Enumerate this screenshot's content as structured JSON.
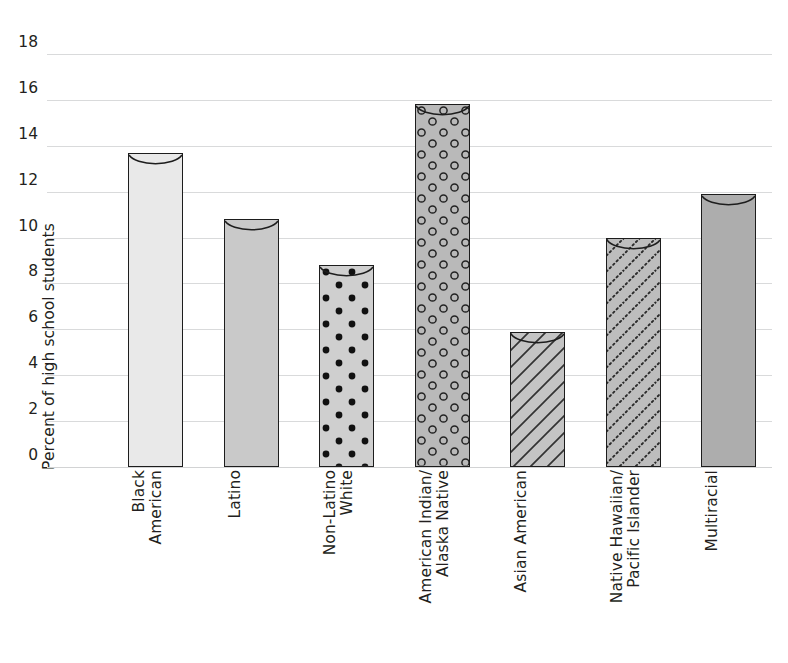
{
  "chart_data": {
    "type": "bar",
    "title": "",
    "xlabel": "",
    "ylabel": "Percent of high school students",
    "ylim": [
      0,
      18
    ],
    "ytick_step": 2,
    "yticks": [
      "18",
      "16",
      "14",
      "12",
      "10",
      "8",
      "6",
      "4",
      "2",
      "0"
    ],
    "grid": true,
    "legend": "none",
    "categories": [
      "Black American",
      "Latino",
      "Non-Latino White",
      "American Indian/ Alaska Native",
      "Asian American",
      "Native Hawaiian/ Pacific Islander",
      "Multiracial"
    ],
    "category_lines": [
      [
        "Black",
        "American"
      ],
      [
        "Latino"
      ],
      [
        "Non-Latino",
        "White"
      ],
      [
        "American Indian/",
        "Alaska Native"
      ],
      [
        "Asian American"
      ],
      [
        "Native Hawaiian/",
        "Pacific Islander"
      ],
      [
        "Multiracial"
      ]
    ],
    "values": [
      13.7,
      10.8,
      8.8,
      15.8,
      5.9,
      10.0,
      11.9
    ],
    "bar_styles": [
      {
        "fill": "#e9e9e9",
        "pattern": "solid"
      },
      {
        "fill": "#c9c9c9",
        "pattern": "solid"
      },
      {
        "fill": "#cfcfcf",
        "pattern": "dots-filled"
      },
      {
        "fill": "#b9b9b9",
        "pattern": "circles-open"
      },
      {
        "fill": "#c4c4c4",
        "pattern": "diagonal-lines"
      },
      {
        "fill": "#bdbdbd",
        "pattern": "diagonal-dotted"
      },
      {
        "fill": "#adadad",
        "pattern": "solid"
      }
    ],
    "colors": {
      "gridline": "#d9dadb",
      "bar_outline": "#1d1d1d",
      "text": "#231f20",
      "background": "#ffffff"
    }
  }
}
